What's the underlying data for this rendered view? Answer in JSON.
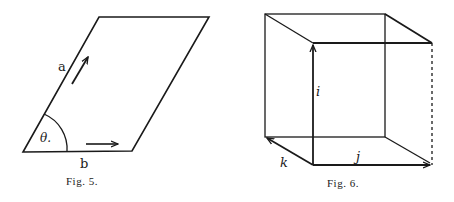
{
  "figures": [
    {
      "caption": "Fig. 5.",
      "shape": "parallelogram",
      "labels": {
        "side_a": "a",
        "side_b": "b",
        "angle": "θ."
      }
    },
    {
      "caption": "Fig. 6.",
      "shape": "cube",
      "labels": {
        "vertical": "i",
        "horizontal": "j",
        "depth": "k"
      }
    }
  ],
  "colors": {
    "ink": "#1a1a1a",
    "background": "#ffffff"
  }
}
